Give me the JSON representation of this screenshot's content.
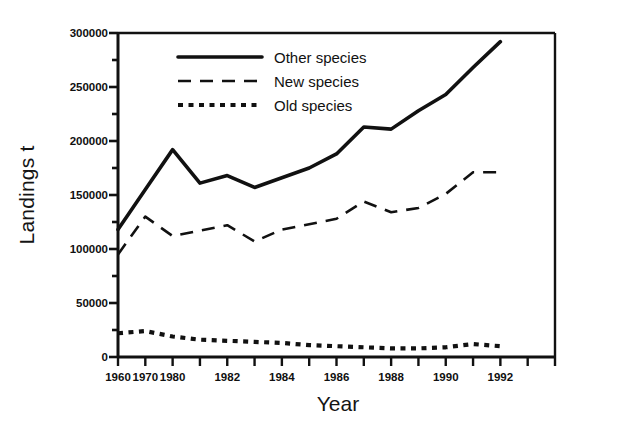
{
  "chart_data": {
    "type": "line",
    "title": "",
    "xlabel": "Year",
    "ylabel": "Landings t",
    "xlim": [
      1960,
      1992
    ],
    "ylim": [
      0,
      300000
    ],
    "grid": false,
    "legend_position": "top-left inside",
    "y_ticks_major": [
      0,
      50000,
      100000,
      150000,
      200000,
      250000,
      300000
    ],
    "y_tick_labels": [
      "0",
      "50000",
      "100000",
      "150000",
      "200000",
      "250000",
      "300000"
    ],
    "y_ticks_minor": [
      25000,
      75000,
      125000,
      175000,
      225000,
      275000
    ],
    "x_tick_positions": [
      0,
      1,
      2,
      3,
      4,
      5,
      6,
      7,
      8,
      9,
      10,
      11,
      12,
      13,
      14,
      15,
      16
    ],
    "x_tick_labels": [
      "1960",
      "1970",
      "1980",
      "",
      "1982",
      "",
      "1984",
      "",
      "1986",
      "",
      "1988",
      "",
      "1990",
      "",
      "1992",
      "",
      ""
    ],
    "x_categories": [
      "1960",
      "1970",
      "1980",
      "1981",
      "1982",
      "1983",
      "1984",
      "1985",
      "1986",
      "1987",
      "1988",
      "1989",
      "1990",
      "1991",
      "1992"
    ],
    "series": [
      {
        "name": "Other species",
        "style": "solid",
        "color": "#111111",
        "values": [
          118000,
          155000,
          192000,
          161000,
          168000,
          157000,
          166000,
          175000,
          188000,
          213000,
          211000,
          228000,
          243000,
          268000,
          292000
        ]
      },
      {
        "name": "New species",
        "style": "dashed",
        "color": "#111111",
        "values": [
          95000,
          130000,
          112000,
          117000,
          122000,
          107000,
          118000,
          123000,
          128000,
          144000,
          134000,
          138000,
          151000,
          171000,
          171000
        ]
      },
      {
        "name": "Old species",
        "style": "dotted",
        "color": "#111111",
        "values": [
          22000,
          24000,
          19000,
          16000,
          15000,
          14000,
          13000,
          11000,
          10000,
          9000,
          8000,
          8000,
          9000,
          12000,
          10000
        ]
      }
    ]
  },
  "axes": {
    "ylabel": "Landings t",
    "xlabel": "Year"
  },
  "legend": {
    "entries": [
      {
        "label": "Other species",
        "style": "solid"
      },
      {
        "label": "New species",
        "style": "dashed"
      },
      {
        "label": "Old species",
        "style": "dotted"
      }
    ]
  }
}
